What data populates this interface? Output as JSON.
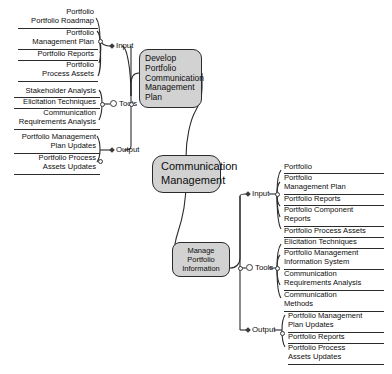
{
  "diagram": {
    "title": "Communication Management",
    "root": {
      "label": "Communication Management"
    },
    "icons": {
      "input_marker": "diamond-marker-icon",
      "tools_marker": "circle-marker-icon",
      "output_marker": "diamond-marker-icon",
      "junction": "junction-node-icon"
    },
    "colors": {
      "node_fill": "#d2d2d2",
      "node_border": "#2b2b2b",
      "connector": "#2b2b2b",
      "background": "#ffffff",
      "text": "#0d0d0d"
    },
    "processes": [
      {
        "id": "develop-portfolio-communication-management-plan",
        "label": "Develop Portfolio Communication Management Plan",
        "side": "left",
        "branches": [
          {
            "id": "input",
            "label": "Input",
            "marker": "diamond-marker-icon",
            "items": [
              "Portfolio\nRoadmap",
              "Portfolio\nManagement Plan",
              "Portfolio Reports",
              "Portfolio\nProcess Assets"
            ]
          },
          {
            "id": "tools",
            "label": "Tools",
            "marker": "circle-marker-icon",
            "items": [
              "Stakeholder Analysis",
              "Elicitation Techniques",
              "Communication\nRequirements Analysis"
            ]
          },
          {
            "id": "output",
            "label": "Output",
            "marker": "diamond-marker-icon",
            "items": [
              "Portfolio Management\nPlan Updates",
              "Portfolio Process\nAssets Updates"
            ]
          }
        ]
      },
      {
        "id": "manage-portfolio-information",
        "label": "Manage Portfolio Information",
        "side": "right",
        "branches": [
          {
            "id": "input",
            "label": "Input",
            "marker": "diamond-marker-icon",
            "items": [
              "Portfolio",
              "Portfolio\nManagement Plan",
              "Portfolio Reports",
              "Portfolio Component\nReports",
              "Portfolio Process Assets"
            ]
          },
          {
            "id": "tools",
            "label": "Tools",
            "marker": "circle-marker-icon",
            "items": [
              "Elicitation Techniques",
              "Portfolio Management\nInformation System",
              "Communication\nRequirements Analysis",
              "Communication\nMethods"
            ]
          },
          {
            "id": "output",
            "label": "Output",
            "marker": "diamond-marker-icon",
            "items": [
              "Portfolio Management\nPlan Updates",
              "Portfolio Reports",
              "Portfolio Process\nAssets Updates"
            ]
          }
        ]
      }
    ],
    "left_leaf_lines": {
      "input": [
        "Portfolio",
        "Portfolio Roadmap",
        "Portfolio",
        "Management Plan",
        "Portfolio Reports",
        "Portfolio",
        "Process Assets"
      ],
      "tools": [
        "Stakeholder Analysis",
        "Elicitation Techniques",
        "Communication",
        "Requirements Analysis"
      ],
      "output": [
        "Portfolio Management",
        "Plan Updates",
        "Portfolio Process",
        "Assets Updates"
      ]
    }
  },
  "left": {
    "input": {
      "label": "Input",
      "i0l0": "Portfolio",
      "i0l1": "Portfolio Roadmap",
      "i1l0": "Portfolio",
      "i1l1": "Management Plan",
      "i2l0": "Portfolio Reports",
      "i3l0": "Portfolio",
      "i3l1": "Process Assets"
    },
    "tools": {
      "label": "Tools",
      "i0l0": "Stakeholder Analysis",
      "i1l0": "Elicitation Techniques",
      "i2l0": "Communication",
      "i2l1": "Requirements Analysis"
    },
    "output": {
      "label": "Output",
      "i0l0": "Portfolio Management",
      "i0l1": "Plan Updates",
      "i1l0": "Portfolio Process",
      "i1l1": "Assets Updates"
    }
  },
  "right": {
    "input": {
      "label": "Input",
      "i0l0": "Portfolio",
      "i1l0": "Portfolio",
      "i1l1": "Management Plan",
      "i2l0": "Portfolio Reports",
      "i3l0": "Portfolio Component",
      "i3l1": "Reports",
      "i4l0": "Portfolio Process Assets"
    },
    "tools": {
      "label": "Tools",
      "i0l0": "Elicitation Techniques",
      "i1l0": "Portfolio Management",
      "i1l1": "Information System",
      "i2l0": "Communication",
      "i2l1": "Requirements Analysis",
      "i3l0": "Communication",
      "i3l1": "Methods"
    },
    "output": {
      "label": "Output",
      "i0l0": "Portfolio Management",
      "i0l1": "Plan Updates",
      "i1l0": "Portfolio Reports",
      "i2l0": "Portfolio Process",
      "i2l1": "Assets Updates"
    }
  },
  "nodes": {
    "develop": {
      "l0": "Develop Portfolio",
      "l1": "Communication",
      "l2": "Management",
      "l3": "Plan"
    },
    "root": {
      "l0": "Communication",
      "l1": "Management"
    },
    "manage": {
      "l0": "Manage",
      "l1": "Portfolio",
      "l2": "Information"
    }
  }
}
